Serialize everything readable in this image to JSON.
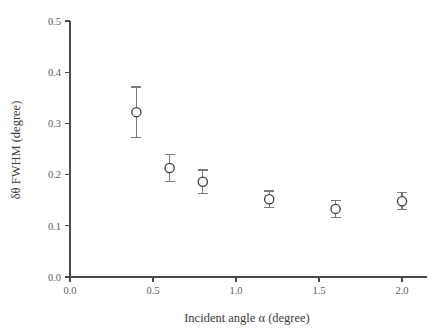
{
  "chart_data": {
    "type": "scatter",
    "title": "",
    "xlabel": "Incident angle α (degree)",
    "ylabel": "δθ FWHM (degree)",
    "xlim": [
      0.0,
      2.15
    ],
    "ylim": [
      0.0,
      0.5
    ],
    "grid": false,
    "legend": null,
    "xticks": [
      0.0,
      0.5,
      1.0,
      1.5,
      2.0
    ],
    "xticklabels": [
      "0.0",
      "0.5",
      "1.0",
      "1.5",
      "2.0"
    ],
    "yticks": [
      0.0,
      0.1,
      0.2,
      0.3,
      0.4,
      0.5
    ],
    "yticklabels": [
      "0.0",
      "0.1",
      "0.2",
      "0.3",
      "0.4",
      "0.5"
    ],
    "marker": "open-circle",
    "errorbars": true,
    "series": [
      {
        "name": "FWHM vs incident angle",
        "x": [
          0.4,
          0.6,
          0.8,
          1.2,
          1.6,
          2.0
        ],
        "y": [
          0.322,
          0.213,
          0.186,
          0.152,
          0.133,
          0.148
        ],
        "yerr": [
          0.049,
          0.026,
          0.023,
          0.016,
          0.017,
          0.017
        ]
      }
    ]
  },
  "axes": {
    "x_title": "Incident angle α (degree)",
    "y_title": "δθ FWHM (degree)"
  },
  "colors": {
    "axis": "#4a4a4a",
    "marker_edge": "#3a3a3a",
    "marker_face": "#ffffff",
    "errorbar": "#7a7a7a",
    "ticklabel": "#5d5d5d",
    "background": "#ffffff"
  }
}
